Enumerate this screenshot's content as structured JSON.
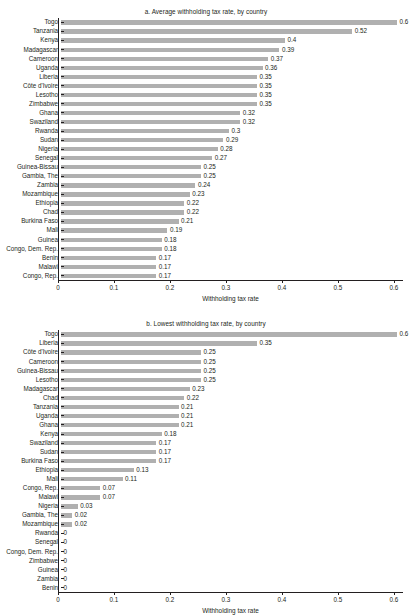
{
  "chart_data": [
    {
      "type": "bar",
      "orientation": "horizontal",
      "title": "a. Average withholding tax rate, by country",
      "xlabel": "Withholding tax rate",
      "ylabel": "",
      "xlim": [
        0,
        0.6
      ],
      "xticks": [
        0,
        0.1,
        0.2,
        0.3,
        0.4,
        0.5,
        0.6
      ],
      "xticklabels": [
        "0",
        "0.1",
        "0.2",
        "0.3",
        "0.4",
        "0.5",
        "0.6"
      ],
      "grid": false,
      "legend": false,
      "bar_color": "#b0b0b0",
      "categories": [
        "Togo",
        "Tanzania",
        "Kenya",
        "Madagascar",
        "Cameroon",
        "Uganda",
        "Liberia",
        "Côte d'Ivoire",
        "Lesotho",
        "Zimbabwe",
        "Ghana",
        "Swaziland",
        "Rwanda",
        "Sudan",
        "Nigeria",
        "Senegal",
        "Guinea-Bissau",
        "Gambia, The",
        "Zambia",
        "Mozambique",
        "Ethiopia",
        "Chad",
        "Burkina Faso",
        "Mali",
        "Guinea",
        "Congo, Dem. Rep.",
        "Benin",
        "Malawi",
        "Congo, Rep."
      ],
      "values": [
        0.6,
        0.52,
        0.4,
        0.39,
        0.37,
        0.36,
        0.35,
        0.35,
        0.35,
        0.35,
        0.32,
        0.32,
        0.3,
        0.29,
        0.28,
        0.27,
        0.25,
        0.25,
        0.24,
        0.23,
        0.22,
        0.22,
        0.21,
        0.19,
        0.18,
        0.18,
        0.17,
        0.17,
        0.17
      ],
      "value_labels": [
        "0.6",
        "0.52",
        "0.4",
        "0.39",
        "0.37",
        "0.36",
        "0.35",
        "0.35",
        "0.35",
        "0.35",
        "0.32",
        "0.32",
        "0.3",
        "0.29",
        "0.28",
        "0.27",
        "0.25",
        "0.25",
        "0.24",
        "0.23",
        "0.22",
        "0.22",
        "0.21",
        "0.19",
        "0.18",
        "0.18",
        "0.17",
        "0.17",
        "0.17"
      ]
    },
    {
      "type": "bar",
      "orientation": "horizontal",
      "title": "b. Lowest withholding tax rate, by country",
      "xlabel": "Withholding tax rate",
      "ylabel": "",
      "xlim": [
        0,
        0.6
      ],
      "xticks": [
        0,
        0.1,
        0.2,
        0.3,
        0.4,
        0.5,
        0.6
      ],
      "xticklabels": [
        "0",
        "0.1",
        "0.2",
        "0.3",
        "0.4",
        "0.5",
        "0.6"
      ],
      "grid": false,
      "legend": false,
      "bar_color": "#b0b0b0",
      "categories": [
        "Togo",
        "Liberia",
        "Côte d'Ivoire",
        "Cameroon",
        "Guinea-Bissau",
        "Lesotho",
        "Madagascar",
        "Chad",
        "Tanzania",
        "Uganda",
        "Ghana",
        "Kenya",
        "Swaziland",
        "Sudan",
        "Burkina Faso",
        "Ethiopia",
        "Mali",
        "Congo, Rep.",
        "Malawi",
        "Nigeria",
        "Gambia, The",
        "Mozambique",
        "Rwanda",
        "Senegal",
        "Congo, Dem. Rep.",
        "Zimbabwe",
        "Guinea",
        "Zambia",
        "Benin"
      ],
      "values": [
        0.6,
        0.35,
        0.25,
        0.25,
        0.25,
        0.25,
        0.23,
        0.22,
        0.21,
        0.21,
        0.21,
        0.18,
        0.17,
        0.17,
        0.17,
        0.13,
        0.11,
        0.07,
        0.07,
        0.03,
        0.02,
        0.02,
        0,
        0,
        0,
        0,
        0,
        0,
        0
      ],
      "value_labels": [
        "0.6",
        "0.35",
        "0.25",
        "0.25",
        "0.25",
        "0.25",
        "0.23",
        "0.22",
        "0.21",
        "0.21",
        "0.21",
        "0.18",
        "0.17",
        "0.17",
        "0.17",
        "0.13",
        "0.11",
        "0.07",
        "0.07",
        "0.03",
        "0.02",
        "0.02",
        "0",
        "0",
        "0",
        "0",
        "0",
        "0",
        "0"
      ]
    }
  ]
}
